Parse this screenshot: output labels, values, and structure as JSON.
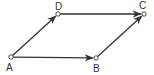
{
  "diagram": {
    "type": "vector-parallelogram",
    "points": [
      {
        "id": "A",
        "label": "A"
      },
      {
        "id": "B",
        "label": "B"
      },
      {
        "id": "C",
        "label": "C"
      },
      {
        "id": "D",
        "label": "D"
      }
    ],
    "vectors": [
      {
        "from": "A",
        "to": "D"
      },
      {
        "from": "D",
        "to": "C"
      },
      {
        "from": "A",
        "to": "B"
      },
      {
        "from": "B",
        "to": "C"
      }
    ],
    "colors": {
      "line": "#333333",
      "point_fill": "#ffffff"
    }
  }
}
